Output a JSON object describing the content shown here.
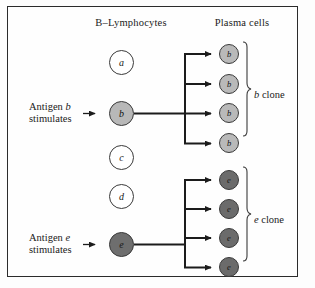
{
  "figure": {
    "background": "#fdfdfd",
    "frame_color": "#2b2b2b"
  },
  "headers": {
    "left": "B–Lymphocytes",
    "right": "Plasma cells"
  },
  "lymphocytes": [
    {
      "label": "a",
      "state": "resting",
      "fill": "#ffffff",
      "x": 109,
      "y": 50
    },
    {
      "label": "b",
      "state": "stimulated",
      "fill": "#b8b8b8",
      "x": 109,
      "y": 101
    },
    {
      "label": "c",
      "state": "resting",
      "fill": "#ffffff",
      "x": 109,
      "y": 145
    },
    {
      "label": "d",
      "state": "resting",
      "fill": "#ffffff",
      "x": 109,
      "y": 184
    },
    {
      "label": "e",
      "state": "stimulated",
      "fill": "#6e6e6e",
      "x": 109,
      "y": 232
    }
  ],
  "plasma_cells": {
    "b_clone": [
      {
        "label": "b",
        "x": 219,
        "y": 44
      },
      {
        "label": "b",
        "x": 219,
        "y": 74
      },
      {
        "label": "b",
        "x": 219,
        "y": 103
      },
      {
        "label": "b",
        "x": 219,
        "y": 133
      }
    ],
    "e_clone": [
      {
        "label": "e",
        "x": 219,
        "y": 170
      },
      {
        "label": "e",
        "x": 219,
        "y": 199
      },
      {
        "label": "e",
        "x": 219,
        "y": 228
      },
      {
        "label": "e",
        "x": 219,
        "y": 257
      }
    ]
  },
  "antigen_stimuli": [
    {
      "line1_prefix": "Antigen ",
      "line1_italic": "b",
      "line2": "stimulates",
      "x": 29,
      "y": 101
    },
    {
      "line1_prefix": "Antigen ",
      "line1_italic": "e",
      "line2": "stimulates",
      "x": 29,
      "y": 232
    }
  ],
  "clone_labels": [
    {
      "italic": "b",
      "text": " clone",
      "x": 254,
      "y": 89
    },
    {
      "italic": "e",
      "text": " clone",
      "x": 254,
      "y": 214
    }
  ],
  "colors": {
    "stroke": "#1c1c1c",
    "cell_outline": "#3a3a3a",
    "brace": "#3b3b3b",
    "text": "#1a1a1a"
  }
}
